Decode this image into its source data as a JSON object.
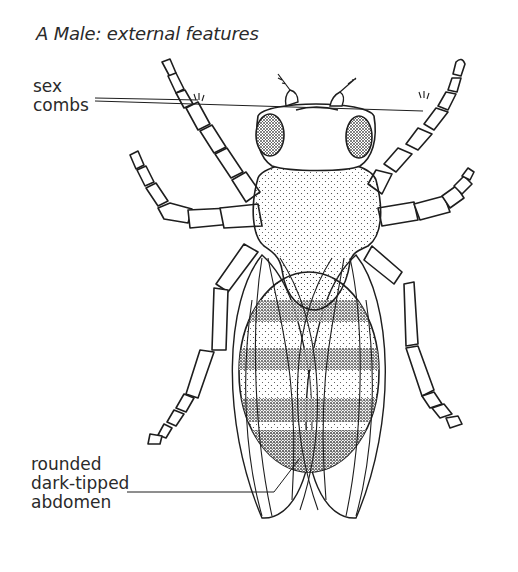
{
  "figure": {
    "title": "A  Male: external features"
  },
  "labels": [
    {
      "id": "sex-combs",
      "lines": [
        "sex",
        "combs"
      ]
    },
    {
      "id": "abdomen",
      "lines": [
        "rounded",
        "dark-tipped",
        "abdomen"
      ]
    }
  ],
  "colors": {
    "ink": "#1e1e1e",
    "background": "#ffffff"
  }
}
